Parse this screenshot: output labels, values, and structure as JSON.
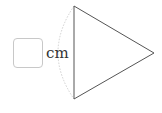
{
  "figure": {
    "shape": "triangle",
    "vertices": [
      [
        74,
        6
      ],
      [
        74,
        99
      ],
      [
        154,
        53
      ]
    ],
    "stroke_color": "#555555",
    "arc": {
      "description": "dotted arc along left side",
      "color": "#d0d0d0"
    }
  },
  "answer": {
    "value": "",
    "unit": "cm"
  }
}
